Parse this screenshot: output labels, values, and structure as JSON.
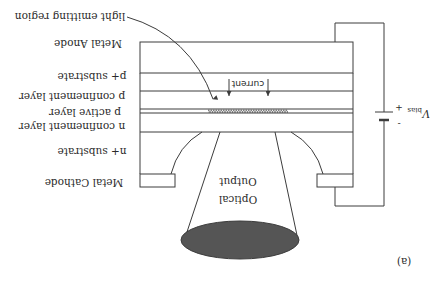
{
  "figure": {
    "label": "(a)",
    "orientation": "rotated 180 degrees",
    "colors": {
      "line": "#3c3c3c",
      "text": "#2a2a2a",
      "ellipse": "#555555",
      "background": "#ffffff"
    }
  },
  "layers": [
    {
      "id": "metal-anode",
      "label": "Metal Anode",
      "hatched": true
    },
    {
      "id": "p-plus-substrate",
      "label": "p+ substrate"
    },
    {
      "id": "p-confinement",
      "label": "p confinement layer"
    },
    {
      "id": "p-active",
      "label": "p active layer"
    },
    {
      "id": "n-confinement",
      "label": "n confinement layer"
    },
    {
      "id": "n-plus-substrate",
      "label": "n+ substrate"
    },
    {
      "id": "metal-cathode",
      "label": "Metal Cathode",
      "hatched": true
    }
  ],
  "annotations": {
    "light_emitting_region": "light emitting region",
    "current": "current",
    "optical_output_line1": "Optical",
    "optical_output_line2": "Output"
  },
  "bias": {
    "label": "V",
    "subscript": "bias",
    "plus": "+",
    "minus": "-"
  }
}
